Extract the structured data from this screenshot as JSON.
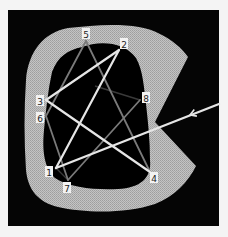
{
  "diagram": {
    "frame": {
      "x": 8,
      "y": 10,
      "width": 211,
      "height": 216,
      "color": "#050505"
    },
    "colors": {
      "background": "#f4f4f4",
      "frame": "#050505",
      "region": "#b8b8b8",
      "hole": "#000000",
      "edge_bright": "#e6e6e6",
      "edge_dim": "#7a7a7a",
      "edge_faint": "#3a3a3a",
      "label_box": "#f2f2f2",
      "label_text": "#222222"
    },
    "nodes": [
      {
        "id": "1",
        "label": "1",
        "x": 56,
        "y": 168,
        "lx": 49,
        "ly": 172
      },
      {
        "id": "2",
        "label": "2",
        "x": 119,
        "y": 50,
        "lx": 124,
        "ly": 44
      },
      {
        "id": "3",
        "label": "3",
        "x": 46,
        "y": 100,
        "lx": 40,
        "ly": 101
      },
      {
        "id": "4",
        "label": "4",
        "x": 150,
        "y": 172,
        "lx": 154,
        "ly": 178
      },
      {
        "id": "5",
        "label": "5",
        "x": 86,
        "y": 41,
        "lx": 86,
        "ly": 34
      },
      {
        "id": "6",
        "label": "6",
        "x": 46,
        "y": 116,
        "lx": 40,
        "ly": 118
      },
      {
        "id": "7",
        "label": "7",
        "x": 68,
        "y": 180,
        "lx": 67,
        "ly": 188
      },
      {
        "id": "8",
        "label": "8",
        "x": 140,
        "y": 100,
        "lx": 146,
        "ly": 98
      }
    ],
    "edges": [
      {
        "from": "3",
        "to": "2",
        "style": "bright"
      },
      {
        "from": "1",
        "to": "2",
        "style": "bright"
      },
      {
        "from": "3",
        "to": "4",
        "style": "bright"
      },
      {
        "from": "5",
        "to": "6",
        "style": "dim"
      },
      {
        "from": "5",
        "to": "4",
        "style": "dim"
      },
      {
        "from": "6",
        "to": "7",
        "style": "dim"
      },
      {
        "from": "7",
        "to": "8",
        "style": "dim"
      },
      {
        "from": "1",
        "to": "7",
        "style": "faint"
      }
    ],
    "partial_edges": [
      {
        "x1": 95,
        "y1": 86,
        "x2": 140,
        "y2": 100,
        "style": "faint"
      }
    ],
    "arrow": {
      "from_x": 219,
      "from_y": 104,
      "to_x": 56,
      "to_y": 168,
      "head_x": 190,
      "head_y": 115,
      "style": "bright"
    }
  }
}
